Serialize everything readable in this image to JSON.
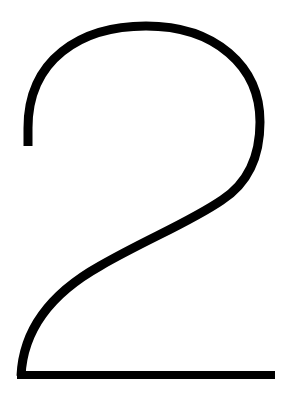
{
  "figure": {
    "character": "2",
    "stroke_color": "#000000",
    "background_color": "#ffffff"
  }
}
